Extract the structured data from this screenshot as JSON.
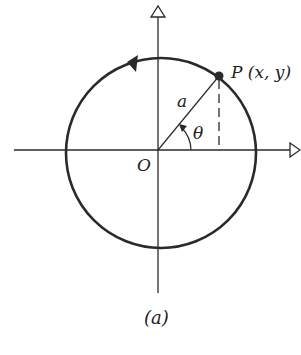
{
  "diagram": {
    "caption": "(a)",
    "labels": {
      "point": "P (x, y)",
      "radius": "a",
      "angle": "θ",
      "origin": "O"
    },
    "colors": {
      "stroke": "#2a2a2a",
      "background": "#ffffff"
    },
    "elements": [
      "horizontal x-axis with hollow arrowhead",
      "vertical y-axis with hollow arrowhead",
      "circle of radius a centered at origin O with counterclockwise arrow",
      "radius line from O to point P",
      "dashed vertical line from P to x-axis",
      "angle arc θ with arrow"
    ]
  }
}
